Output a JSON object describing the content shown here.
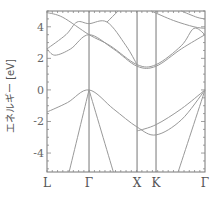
{
  "chart_data": {
    "type": "line",
    "title": "",
    "xlabel": "",
    "ylabel": "エネルギー [eV]",
    "ylim": [
      -5.2,
      5.0
    ],
    "yticks": [
      "4",
      "2",
      "0",
      "-2",
      "-4"
    ],
    "ytick_values": [
      4,
      2,
      0,
      -2,
      -4
    ],
    "xticks": [
      "L",
      "Γ",
      "X",
      "K",
      "Γ"
    ],
    "xtick_positions": [
      0.0,
      0.266,
      0.57,
      0.69,
      1.0
    ],
    "grid": false,
    "legend": null,
    "series": [
      {
        "name": "valence-1",
        "x": [
          0,
          0.13,
          0.266,
          0.42,
          0.57,
          0.69,
          0.85,
          1.0
        ],
        "y": [
          -1.4,
          -0.8,
          0.0,
          -1.2,
          -2.35,
          -2.85,
          -1.9,
          0.0
        ]
      },
      {
        "name": "valence-2",
        "x": [
          0.57,
          0.69,
          0.85,
          1.0
        ],
        "y": [
          -2.6,
          -2.2,
          -1.2,
          0.0
        ]
      },
      {
        "name": "valence-3",
        "x": [
          0.266,
          0.14
        ],
        "y": [
          0.0,
          -5.2
        ]
      },
      {
        "name": "valence-4",
        "x": [
          0.266,
          0.42
        ],
        "y": [
          0.0,
          -5.2
        ]
      },
      {
        "name": "valence-5",
        "x": [
          1.0,
          0.83
        ],
        "y": [
          0.0,
          -5.2
        ]
      },
      {
        "name": "conduction-1",
        "x": [
          0,
          0.05,
          0.15,
          0.266,
          0.42,
          0.57,
          0.69,
          0.85,
          1.0
        ],
        "y": [
          2.6,
          2.2,
          2.6,
          3.5,
          2.6,
          1.5,
          1.5,
          2.6,
          3.5
        ]
      },
      {
        "name": "conduction-2",
        "x": [
          0,
          0.1,
          0.266,
          0.4,
          0.57,
          0.69,
          0.85,
          0.93,
          1.0
        ],
        "y": [
          4.9,
          4.6,
          3.5,
          2.8,
          1.6,
          1.6,
          2.8,
          3.9,
          3.5
        ]
      },
      {
        "name": "conduction-3",
        "x": [
          0,
          0.12,
          0.19,
          0.266,
          0.38,
          0.5,
          0.57
        ],
        "y": [
          2.6,
          3.5,
          4.3,
          4.2,
          4.3,
          2.8,
          1.6
        ]
      },
      {
        "name": "conduction-4",
        "x": [
          0.38,
          0.45
        ],
        "y": [
          4.3,
          5.0
        ]
      },
      {
        "name": "conduction-5",
        "x": [
          0.66,
          0.8,
          0.93,
          1.0
        ],
        "y": [
          5.0,
          4.4,
          4.0,
          3.9
        ]
      },
      {
        "name": "conduction-6",
        "x": [
          0.85,
          0.95,
          1.0
        ],
        "y": [
          5.0,
          4.6,
          4.5
        ]
      }
    ]
  }
}
